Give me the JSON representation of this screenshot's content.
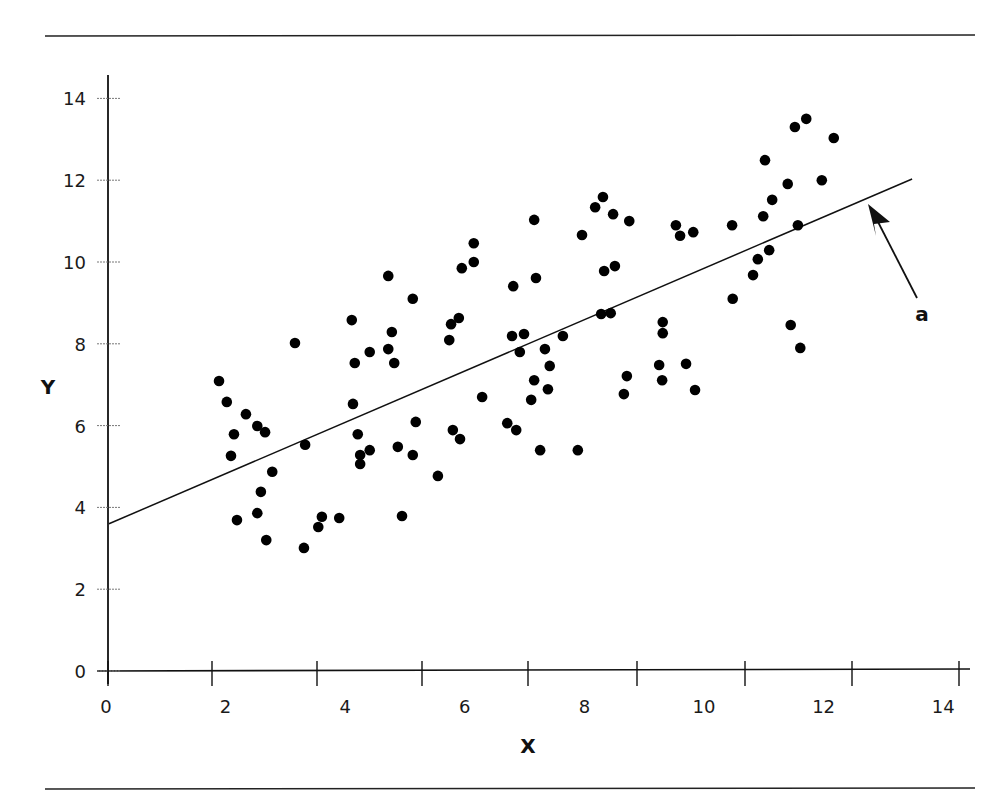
{
  "chart_data": {
    "type": "scatter",
    "title": "",
    "xlabel": "X",
    "ylabel": "Y",
    "xlim": [
      0,
      14
    ],
    "ylim": [
      0,
      14
    ],
    "x_ticks": [
      0,
      2,
      4,
      6,
      8,
      10,
      12,
      14
    ],
    "y_ticks": [
      0,
      2,
      4,
      6,
      8,
      10,
      12,
      14
    ],
    "grid": false,
    "legend": null,
    "series": [
      {
        "name": "observations",
        "marker": "filled-circle",
        "color": "#000000",
        "points": [
          [
            1.89,
            7.09
          ],
          [
            2.02,
            6.58
          ],
          [
            2.14,
            5.79
          ],
          [
            2.09,
            5.26
          ],
          [
            2.34,
            6.28
          ],
          [
            2.53,
            5.99
          ],
          [
            2.66,
            5.84
          ],
          [
            2.78,
            4.87
          ],
          [
            2.59,
            4.38
          ],
          [
            2.19,
            3.69
          ],
          [
            2.53,
            3.86
          ],
          [
            2.68,
            3.2
          ],
          [
            3.16,
            8.02
          ],
          [
            3.33,
            5.53
          ],
          [
            3.31,
            3.01
          ],
          [
            3.61,
            3.77
          ],
          [
            3.55,
            3.52
          ],
          [
            3.9,
            3.74
          ],
          [
            4.11,
            8.58
          ],
          [
            4.16,
            7.53
          ],
          [
            4.13,
            6.53
          ],
          [
            4.21,
            5.79
          ],
          [
            4.25,
            5.28
          ],
          [
            4.25,
            5.06
          ],
          [
            4.41,
            5.4
          ],
          [
            4.41,
            7.8
          ],
          [
            4.72,
            9.66
          ],
          [
            4.72,
            7.87
          ],
          [
            4.78,
            8.29
          ],
          [
            4.82,
            7.53
          ],
          [
            4.88,
            5.48
          ],
          [
            4.95,
            3.79
          ],
          [
            5.13,
            9.1
          ],
          [
            5.13,
            5.28
          ],
          [
            5.18,
            6.09
          ],
          [
            5.55,
            4.77
          ],
          [
            5.74,
            8.09
          ],
          [
            5.77,
            8.48
          ],
          [
            5.9,
            8.63
          ],
          [
            5.8,
            5.89
          ],
          [
            5.92,
            5.67
          ],
          [
            5.95,
            9.85
          ],
          [
            6.15,
            10.0
          ],
          [
            6.15,
            10.46
          ],
          [
            6.29,
            6.7
          ],
          [
            6.71,
            6.06
          ],
          [
            6.79,
            8.19
          ],
          [
            6.81,
            9.41
          ],
          [
            6.86,
            5.89
          ],
          [
            6.92,
            7.8
          ],
          [
            6.99,
            8.24
          ],
          [
            7.11,
            6.63
          ],
          [
            7.16,
            7.11
          ],
          [
            7.16,
            11.03
          ],
          [
            7.19,
            9.61
          ],
          [
            7.26,
            5.4
          ],
          [
            7.34,
            7.87
          ],
          [
            7.39,
            6.89
          ],
          [
            7.42,
            7.46
          ],
          [
            7.64,
            8.19
          ],
          [
            7.89,
            5.4
          ],
          [
            7.96,
            10.66
          ],
          [
            8.18,
            11.34
          ],
          [
            8.31,
            11.59
          ],
          [
            8.28,
            8.73
          ],
          [
            8.33,
            9.78
          ],
          [
            8.44,
            8.75
          ],
          [
            8.48,
            11.17
          ],
          [
            8.51,
            9.9
          ],
          [
            8.66,
            6.77
          ],
          [
            8.71,
            7.21
          ],
          [
            8.75,
            11.0
          ],
          [
            9.25,
            7.48
          ],
          [
            9.3,
            7.11
          ],
          [
            9.31,
            8.53
          ],
          [
            9.31,
            8.26
          ],
          [
            9.53,
            10.9
          ],
          [
            9.6,
            10.64
          ],
          [
            9.7,
            7.51
          ],
          [
            9.82,
            10.73
          ],
          [
            9.85,
            6.87
          ],
          [
            10.47,
            10.9
          ],
          [
            10.48,
            9.1
          ],
          [
            10.82,
            9.68
          ],
          [
            10.9,
            10.07
          ],
          [
            10.99,
            11.12
          ],
          [
            11.02,
            12.49
          ],
          [
            11.09,
            10.29
          ],
          [
            11.14,
            11.52
          ],
          [
            11.4,
            11.91
          ],
          [
            11.45,
            8.46
          ],
          [
            11.52,
            13.3
          ],
          [
            11.57,
            10.9
          ],
          [
            11.61,
            7.9
          ],
          [
            11.71,
            13.5
          ],
          [
            11.97,
            12.0
          ],
          [
            12.17,
            13.03
          ]
        ]
      }
    ],
    "regression_line": {
      "label": "a",
      "x_start": 0.05,
      "y_start": 3.6,
      "x_end": 13.48,
      "y_end": 12.03
    },
    "annotations": [
      {
        "text": "a",
        "points_to": "regression_line",
        "type": "arrow"
      }
    ]
  },
  "labels": {
    "x_axis_title": "X",
    "y_axis_title": "Y",
    "annotation_a": "a"
  },
  "colors": {
    "ink": "#111111",
    "background": "#ffffff"
  }
}
